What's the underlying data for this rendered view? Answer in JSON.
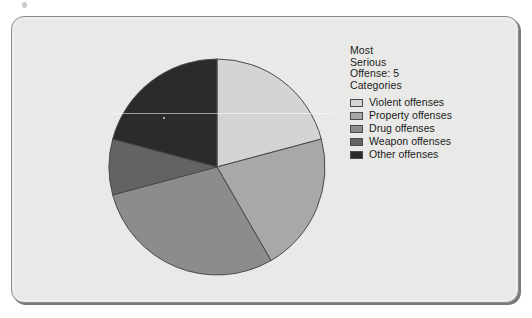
{
  "panel": {
    "background_color": "#e9e9e7",
    "border_color": "#8d8d8d"
  },
  "legend": {
    "title": "Most\nSerious\nOffense: 5\nCategories",
    "items": [
      {
        "label": "Violent offenses",
        "color": "#d4d4d2"
      },
      {
        "label": "Property offenses",
        "color": "#a8a8a6"
      },
      {
        "label": "Drug offenses",
        "color": "#8c8c8a"
      },
      {
        "label": "Weapon offenses",
        "color": "#636361"
      },
      {
        "label": "Other offenses",
        "color": "#2b2b2b"
      }
    ]
  },
  "chart_data": {
    "type": "pie",
    "title": "Most Serious Offense: 5 Categories",
    "legend_position": "right",
    "start_angle_deg": 0,
    "direction": "clockwise",
    "categories": [
      "Violent offenses",
      "Property offenses",
      "Drug offenses",
      "Weapon offenses",
      "Other offenses"
    ],
    "values": [
      21,
      21,
      29,
      8,
      21
    ],
    "value_unit": "percent",
    "slice_angles_deg": [
      75,
      75,
      105,
      30,
      75
    ],
    "colors": [
      "#d4d4d2",
      "#a8a8a6",
      "#8c8c8a",
      "#636361",
      "#2b2b2b"
    ],
    "slice_border_color": "#4a4a4a",
    "data_labels_shown": false,
    "grid": false
  }
}
